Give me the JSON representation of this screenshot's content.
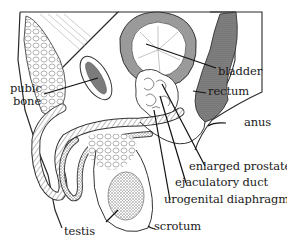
{
  "diagram": {
    "labels": {
      "bladder": "bladder",
      "rectum": "rectum",
      "pubic_bone_line1": "pubic",
      "pubic_bone_line2": "bone",
      "anus": "anus",
      "enlarged_prostate": "enlarged prostate",
      "ejaculatory_duct": "ejaculatory duct",
      "urogenital_diaphragm": "urogenital diaphragm",
      "testis": "testis",
      "scrotum": "scrotum"
    },
    "colors": {
      "ink": "#1a1a1a",
      "shade": "#7a7a7a",
      "light_shade": "#b8b8b8",
      "background": "#ffffff"
    }
  }
}
